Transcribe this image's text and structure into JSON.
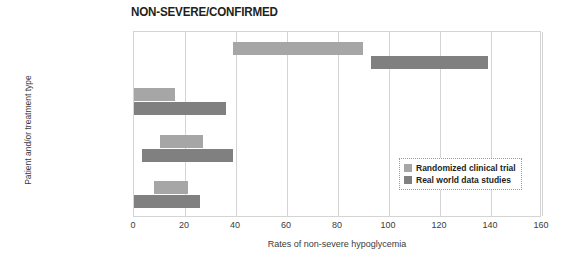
{
  "chart_data": {
    "type": "bar",
    "orientation": "horizontal",
    "title": "NON-SEVERE/CONFIRMED",
    "xlabel": "Rates of non-severe hypoglycemia",
    "ylabel": "Patient and/or treatment type",
    "categories": [
      "T1DM",
      "T2DM basal-oral",
      "T2DM basal-bolus",
      "T2DM premix"
    ],
    "xlim": [
      0,
      160
    ],
    "xticks": [
      0,
      20,
      40,
      60,
      80,
      100,
      120,
      140,
      160
    ],
    "xtick_labels": [
      "0",
      "20",
      "40",
      "60",
      "80",
      "100",
      "120",
      "140",
      "160"
    ],
    "grid": "vertical",
    "legend_position": "inside-right",
    "series": [
      {
        "name": "Randomized clinical trial",
        "color": "#a6a6a6",
        "ranges": [
          {
            "category": "T1DM",
            "start": 39,
            "end": 90
          },
          {
            "category": "T2DM basal-oral",
            "start": 0,
            "end": 16
          },
          {
            "category": "T2DM basal-bolus",
            "start": 10,
            "end": 27
          },
          {
            "category": "T2DM premix",
            "start": 8,
            "end": 21
          }
        ]
      },
      {
        "name": "Real world data studies",
        "color": "#808080",
        "ranges": [
          {
            "category": "T1DM",
            "start": 93,
            "end": 139
          },
          {
            "category": "T2DM basal-oral",
            "start": 0,
            "end": 36
          },
          {
            "category": "T2DM basal-bolus",
            "start": 3,
            "end": 39
          },
          {
            "category": "T2DM premix",
            "start": 0,
            "end": 26
          }
        ]
      }
    ]
  },
  "legend": {
    "items": [
      {
        "label": "Randomized clinical trial",
        "swatch": "rct"
      },
      {
        "label": "Real world data studies",
        "swatch": "rwd"
      }
    ]
  }
}
